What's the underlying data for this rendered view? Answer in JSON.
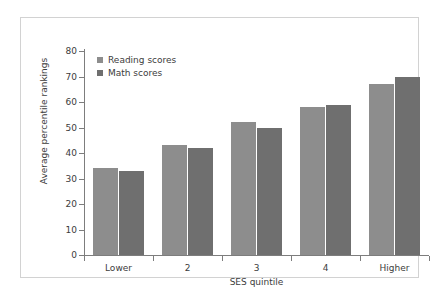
{
  "chart_data": {
    "type": "bar",
    "title": "",
    "subtitle": "",
    "xlabel": "SES quintile",
    "ylabel": "Average percentile rankings",
    "categories": [
      "Lower",
      "2",
      "3",
      "4",
      "Higher"
    ],
    "series": [
      {
        "name": "Reading scores",
        "values": [
          34,
          43,
          52,
          58,
          67
        ],
        "color": "#8d8d8d"
      },
      {
        "name": "Math scores",
        "values": [
          33,
          42,
          50,
          59,
          70
        ],
        "color": "#6f6f6f"
      }
    ],
    "ylim": [
      0,
      80
    ],
    "ytick_step": 10,
    "yticks": [
      0,
      10,
      20,
      30,
      40,
      50,
      60,
      70,
      80
    ],
    "ytick_labels": [
      "0",
      "10",
      "20",
      "30",
      "40",
      "50",
      "60",
      "70",
      "80"
    ],
    "grid": false,
    "legend_position": "top-left",
    "frame_color": "#d2d2d2",
    "axis_color": "#7d7d7d",
    "background": "#ffffff"
  },
  "legend": {
    "entries": [
      {
        "label": "Reading scores",
        "swatch": "legend-swatch-reading"
      },
      {
        "label": "Math scores",
        "swatch": "legend-swatch-math"
      }
    ]
  }
}
